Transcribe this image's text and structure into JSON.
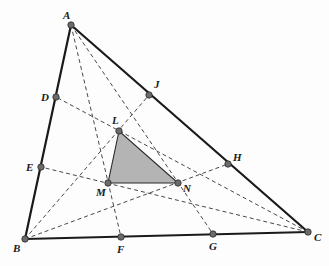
{
  "figure": {
    "colors": {
      "side": "#1a1a1a",
      "cevian": "#333333",
      "point_fill": "#6b6b6b",
      "shaded_triangle": "#b4b4b4",
      "background": "#fdfdfd"
    },
    "points": {
      "A": {
        "label": "A",
        "x": 71,
        "y": 25
      },
      "B": {
        "label": "B",
        "x": 25,
        "y": 239
      },
      "C": {
        "label": "C",
        "x": 308,
        "y": 232
      },
      "D": {
        "label": "D",
        "x": 56,
        "y": 97
      },
      "E": {
        "label": "E",
        "x": 41,
        "y": 167
      },
      "F": {
        "label": "F",
        "x": 121,
        "y": 237
      },
      "G": {
        "label": "G",
        "x": 213,
        "y": 234
      },
      "H": {
        "label": "H",
        "x": 228,
        "y": 164
      },
      "J": {
        "label": "J",
        "x": 149,
        "y": 95
      },
      "L": {
        "label": "L",
        "x": 119,
        "y": 131
      },
      "M": {
        "label": "M",
        "x": 108,
        "y": 183
      },
      "N": {
        "label": "N",
        "x": 178,
        "y": 183
      }
    },
    "sides": [
      [
        "A",
        "B"
      ],
      [
        "B",
        "C"
      ],
      [
        "C",
        "A"
      ]
    ],
    "cevians": [
      [
        "A",
        "F"
      ],
      [
        "A",
        "G"
      ],
      [
        "B",
        "J"
      ],
      [
        "B",
        "H"
      ],
      [
        "C",
        "D"
      ],
      [
        "C",
        "E"
      ]
    ],
    "shaded_triangle": [
      "L",
      "M",
      "N"
    ]
  }
}
